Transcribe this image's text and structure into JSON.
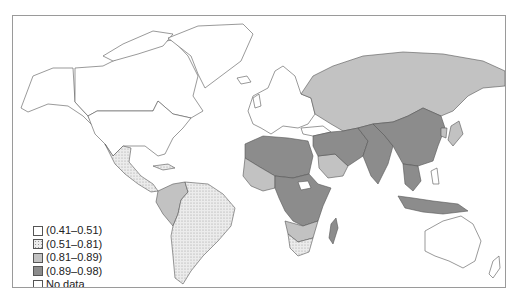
{
  "map": {
    "type": "choropleth-world",
    "projection": "equirectangular-like",
    "colors": {
      "c1": "#ffffff",
      "c2": "#e6e6e6",
      "c3": "#c2c2c2",
      "c4": "#8c8c8c",
      "nodata": "#ffffff",
      "border": "#555555",
      "water": "#ffffff"
    }
  },
  "legend": {
    "items": [
      {
        "label": "(0.41–0.51)",
        "swatch": "#ffffff",
        "pattern": "none"
      },
      {
        "label": "(0.51–0.81)",
        "swatch": "#e6e6e6",
        "pattern": "dotted"
      },
      {
        "label": "(0.81–0.89)",
        "swatch": "#c2c2c2",
        "pattern": "none"
      },
      {
        "label": "(0.89–0.98)",
        "swatch": "#8c8c8c",
        "pattern": "none"
      },
      {
        "label": "No data",
        "swatch": "#ffffff",
        "pattern": "none"
      }
    ]
  },
  "regions": [
    {
      "name": "North America",
      "class": "(0.41–0.51)"
    },
    {
      "name": "Greenland",
      "class": "(0.41–0.51)"
    },
    {
      "name": "Mexico & Central America",
      "class": "(0.51–0.81)"
    },
    {
      "name": "South America",
      "class": "(0.51–0.81)"
    },
    {
      "name": "Andean countries",
      "class": "(0.81–0.89)"
    },
    {
      "name": "Europe",
      "class": "(0.41–0.51)"
    },
    {
      "name": "Russia & Central Asia",
      "class": "(0.81–0.89)"
    },
    {
      "name": "North Africa",
      "class": "(0.89–0.98)"
    },
    {
      "name": "West Africa",
      "class": "(0.81–0.89)"
    },
    {
      "name": "Central & East Africa",
      "class": "(0.89–0.98)"
    },
    {
      "name": "Southern Africa",
      "class": "(0.81–0.89)"
    },
    {
      "name": "South Africa",
      "class": "(0.51–0.81)"
    },
    {
      "name": "Middle East",
      "class": "(0.89–0.98)"
    },
    {
      "name": "Saudi Arabia",
      "class": "(0.81–0.89)"
    },
    {
      "name": "South Asia",
      "class": "(0.89–0.98)"
    },
    {
      "name": "China & Mongolia",
      "class": "(0.89–0.98)"
    },
    {
      "name": "Japan & Korea",
      "class": "(0.81–0.89)"
    },
    {
      "name": "Southeast Asia",
      "class": "(0.89–0.98)"
    },
    {
      "name": "Madagascar",
      "class": "(0.89–0.98)"
    },
    {
      "name": "Australia & New Zealand",
      "class": "(0.41–0.51)"
    }
  ]
}
